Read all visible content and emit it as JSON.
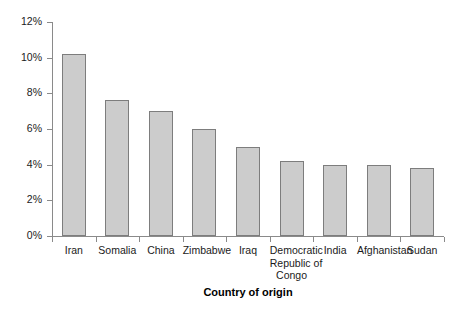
{
  "chart_data": {
    "type": "bar",
    "title": "",
    "xlabel": "Country of origin",
    "ylabel": "",
    "categories": [
      "Iran",
      "Somalia",
      "China",
      "Zimbabwe",
      "Iraq",
      "Democratic Republic of Congo",
      "India",
      "Afghanistan",
      "Sudan"
    ],
    "category_lines": [
      [
        "Iran"
      ],
      [
        "Somalia"
      ],
      [
        "China"
      ],
      [
        "Zimbabwe"
      ],
      [
        "Iraq"
      ],
      [
        "Democratic",
        "Republic of",
        "Congo"
      ],
      [
        "India"
      ],
      [
        "Afghanistan"
      ],
      [
        "Sudan"
      ]
    ],
    "values": [
      10.2,
      7.6,
      7.0,
      6.0,
      5.0,
      4.2,
      4.0,
      4.0,
      3.8
    ],
    "ylim": [
      0,
      12
    ],
    "ytick_values": [
      0,
      2,
      4,
      6,
      8,
      10,
      12
    ],
    "ytick_labels": [
      "0%",
      "2%",
      "4%",
      "6%",
      "8%",
      "10%",
      "12%"
    ],
    "grid": false,
    "legend": "none",
    "value_unit": "%",
    "bar_color": "#cccccc",
    "bar_border_color": "#7d7d7d",
    "axis_color": "#8a8a8a",
    "background_color": "#ffffff"
  }
}
